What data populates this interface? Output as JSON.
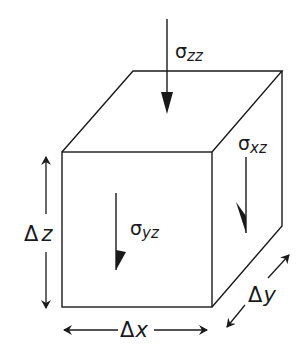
{
  "diagram": {
    "type": "stress-element-cube",
    "colors": {
      "stroke": "#1a1a1a",
      "background": "#ffffff"
    },
    "labels": {
      "sigma_zz": {
        "symbol": "σ",
        "subscript": "zz"
      },
      "sigma_xz": {
        "symbol": "σ",
        "subscript": "xz"
      },
      "sigma_yz": {
        "symbol": "σ",
        "subscript": "yz"
      },
      "delta_z": {
        "symbol": "Δ",
        "var": "z"
      },
      "delta_x": {
        "symbol": "Δ",
        "var": "x"
      },
      "delta_y": {
        "symbol": "Δ",
        "var": "y"
      }
    }
  }
}
